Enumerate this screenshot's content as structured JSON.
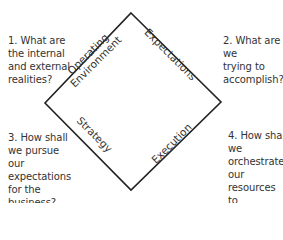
{
  "diagram": {
    "shape": "diamond",
    "line_color": "#222222",
    "text_color": "#333333",
    "vertices": {
      "top": [
        131,
        13
      ],
      "right": [
        221,
        102
      ],
      "bottom": [
        131,
        190
      ],
      "left": [
        45,
        103
      ]
    },
    "edges": [
      {
        "position": "top-left",
        "label": "Operating\nEnvironment"
      },
      {
        "position": "top-right",
        "label": "Expectations"
      },
      {
        "position": "bottom-left",
        "label": "Strategy"
      },
      {
        "position": "bottom-right",
        "label": "Execution"
      }
    ],
    "questions": [
      {
        "number": 1,
        "position": "top-left",
        "text": "1. What are\nthe internal\nand external\nrealities?"
      },
      {
        "number": 2,
        "position": "top-right",
        "text": "2. What are we\ntrying to\naccomplish?"
      },
      {
        "number": 3,
        "position": "bottom-left",
        "text": "3. How shall\nwe pursue our\nexpectations\nfor the\nbusiness?"
      },
      {
        "number": 4,
        "position": "bottom-right",
        "text": "4. How shall we\norchestrate our\nresources to\nexecute our\nplan?"
      }
    ]
  }
}
